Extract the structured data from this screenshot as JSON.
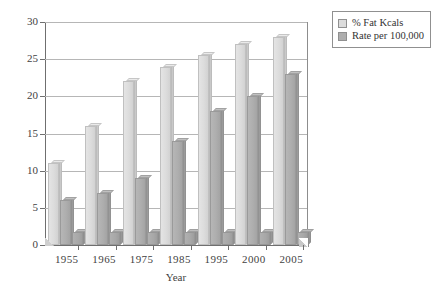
{
  "chart_data": {
    "type": "bar",
    "title": "",
    "subtitle": "",
    "xlabel": "Year",
    "ylabel": "",
    "categories": [
      "1955",
      "1965",
      "1975",
      "1985",
      "1995",
      "2000",
      "2005"
    ],
    "series": [
      {
        "name": "% Fat Kcals",
        "color": "#dcdcdc",
        "values": [
          11,
          16,
          22,
          24,
          25.5,
          27,
          28
        ]
      },
      {
        "name": "Rate per 100,000",
        "color": "#aeaeae",
        "values": [
          6,
          7,
          9,
          14,
          18,
          20,
          23
        ]
      },
      {
        "name": "",
        "color": "#a8a8a8",
        "values": [
          1.7,
          1.7,
          1.7,
          1.7,
          1.7,
          1.7,
          1.7
        ]
      }
    ],
    "ylim": [
      0,
      30
    ],
    "yticks": [
      "0",
      "5",
      "10",
      "15",
      "20",
      "25",
      "30"
    ],
    "ytick_values": [
      0,
      5,
      10,
      15,
      20,
      25,
      30
    ],
    "grid": true,
    "grid_axis": "y",
    "legend_position": "top-right",
    "style": "3d-bar"
  },
  "legend": {
    "items": [
      {
        "label": "% Fat Kcals",
        "swatch": "#dcdcdc"
      },
      {
        "label": "Rate per 100,000",
        "swatch": "#aeaeae"
      }
    ]
  },
  "axis": {
    "x_title": "Year"
  }
}
